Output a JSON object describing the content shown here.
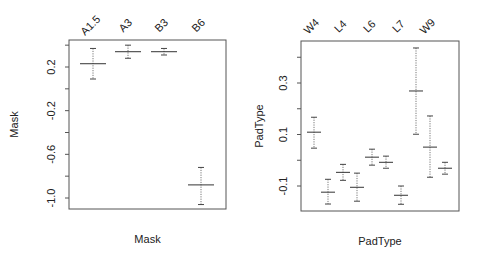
{
  "chart_data": [
    {
      "type": "errorbar",
      "title": "",
      "xlabel": "Mask",
      "ylabel": "Mask",
      "categories": [
        "A1.5",
        "A3",
        "B3",
        "B6"
      ],
      "visible_tick_labels": [
        "A1.5",
        "A3",
        "B3",
        "B6"
      ],
      "values": [
        0.23,
        0.34,
        0.34,
        -0.88
      ],
      "upper": [
        0.37,
        0.4,
        0.37,
        -0.72
      ],
      "lower": [
        0.09,
        0.28,
        0.31,
        -1.06
      ],
      "yticks": [
        0.4,
        0.2,
        0.0,
        -0.2,
        -0.4,
        -0.6,
        -0.8,
        -1.0
      ],
      "ytick_labels": [
        "0.2",
        "-0.2",
        "-0.6",
        "-1.0"
      ],
      "ylim": [
        -1.1,
        0.44
      ],
      "grid": false,
      "legend": null
    },
    {
      "type": "errorbar",
      "title": "",
      "xlabel": "PadType",
      "ylabel": "PadType",
      "categories": [
        "W4",
        "",
        "L4",
        "",
        "L6",
        "",
        "L7",
        "",
        "W9",
        ""
      ],
      "visible_tick_labels": [
        "W4",
        "L4",
        "L6",
        "L7",
        "W9"
      ],
      "values": [
        0.109,
        -0.124,
        -0.047,
        -0.105,
        0.012,
        -0.008,
        -0.136,
        0.269,
        0.051,
        -0.031
      ],
      "upper": [
        0.167,
        -0.074,
        -0.016,
        -0.05,
        0.043,
        0.016,
        -0.1,
        0.436,
        0.172,
        -0.008
      ],
      "lower": [
        0.047,
        -0.17,
        -0.078,
        -0.159,
        -0.019,
        -0.031,
        -0.171,
        0.101,
        -0.066,
        -0.054
      ],
      "yticks": [
        0.4,
        0.3,
        0.2,
        0.1,
        0.0,
        -0.1
      ],
      "ytick_labels": [
        "0.3",
        "0.1",
        "-0.1"
      ],
      "ylim": [
        -0.2,
        0.47
      ],
      "grid": false,
      "legend": null
    }
  ],
  "panels": [
    {
      "id": "mask",
      "frame": {
        "x": 69,
        "y": 40,
        "w": 157,
        "h": 169
      },
      "y_to_px": {
        "v0": 0.2,
        "p0": 67,
        "v1": -1.0,
        "p1": 198
      },
      "bar_x": [
        93,
        128,
        164,
        201
      ],
      "label_x": [
        93,
        128,
        164,
        201
      ],
      "ylabel_x": 18,
      "xlabel_y": 243,
      "mean_halfwidth": 13
    },
    {
      "id": "padtype",
      "frame": {
        "x": 301,
        "y": 41,
        "w": 158,
        "h": 170
      },
      "y_to_px": {
        "v0": 0.3,
        "p0": 83,
        "v1": -0.1,
        "p1": 186
      },
      "bar_x": [
        314,
        328,
        343,
        357,
        372,
        386,
        401,
        416,
        430,
        445
      ],
      "label_x": [
        314,
        343,
        372,
        401,
        430
      ],
      "ylabel_x": 263,
      "xlabel_y": 245,
      "mean_halfwidth": 7
    }
  ]
}
